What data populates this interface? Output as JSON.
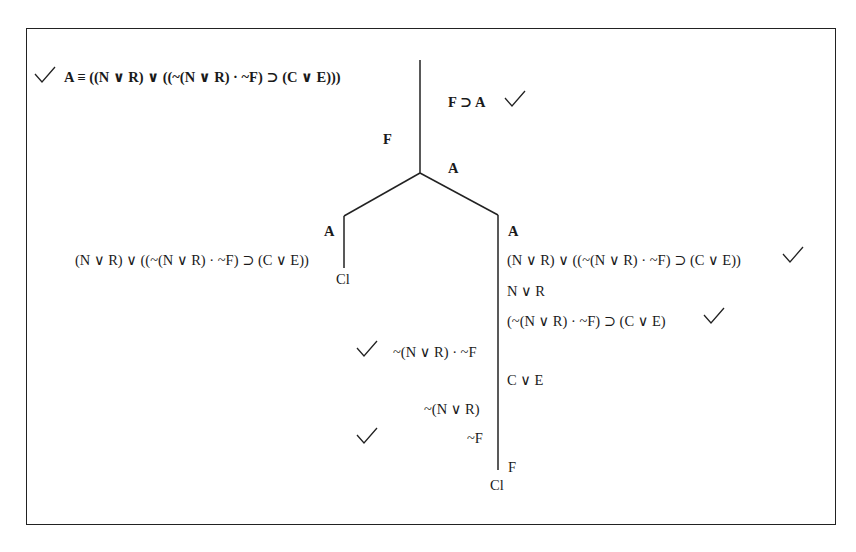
{
  "diagram": {
    "type": "truth-tree",
    "nodes": {
      "premise": "A ≡ ((N ∨ R) ∨ ((~(N ∨ R) · ~F) ⊃ (C ∨ E)))",
      "premise2": "F ⊃ A",
      "trunk_left_F": "F",
      "trunk_right_A": "A",
      "left_branch": {
        "label_A": "A",
        "formula": "(N ∨ R) ∨ ((~(N ∨ R) · ~F) ⊃ (C ∨ E))",
        "closed": "Cl"
      },
      "right_branch": {
        "label_A": "A",
        "formula": "(N ∨ R) ∨ ((~(N ∨ R) · ~F) ⊃ (C ∨ E))",
        "n_or_r": "N ∨ R",
        "conditional": "(~(N ∨ R) · ~F) ⊃ (C ∨ E)",
        "c_or_e": "C ∨ E",
        "F": "F",
        "closed": "Cl"
      },
      "sub_left": {
        "conjunction": "~(N ∨ R) · ~F",
        "neg_n_or_r": "~(N ∨ R)",
        "neg_F": "~F"
      }
    },
    "checkmarks": [
      "premise",
      "premise2",
      "right_branch.formula",
      "right_branch.conditional",
      "sub_left.conjunction",
      "sub_left.neg_F"
    ],
    "colors": {
      "line": "#222222",
      "text": "#1a1a1a",
      "background": "#ffffff"
    }
  }
}
